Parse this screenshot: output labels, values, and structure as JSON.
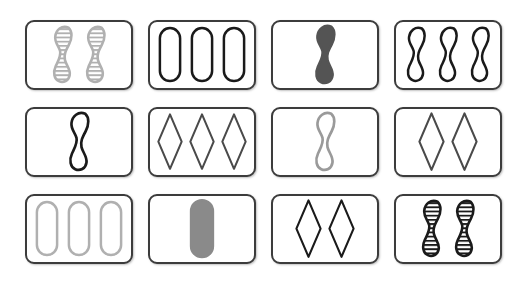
{
  "game": {
    "name": "SET card game board",
    "layout": {
      "rows": 3,
      "columns": 4,
      "total_cards": 12
    },
    "palette": {
      "card_border": "#3c3c3c",
      "card_face": "#ffffff",
      "background": "#ffffff",
      "black": "#1a1a1a",
      "dark_gray": "#545454",
      "medium_gray": "#8a8a8a",
      "light_gray": "#b5b5b5"
    },
    "attribute_options": {
      "shape": [
        "squiggle",
        "oval",
        "diamond"
      ],
      "count": [
        1,
        2,
        3
      ],
      "shading": [
        "solid",
        "striped",
        "empty"
      ],
      "color": [
        "black",
        "dark_gray",
        "medium_gray",
        "light_gray"
      ]
    }
  },
  "cards": [
    {
      "position": "row1-col1",
      "label": "two gray striped squiggles",
      "shape": "squiggle",
      "count": 2,
      "shading": "striped",
      "color": "light_gray",
      "hex": "#b0b0b0"
    },
    {
      "position": "row1-col2",
      "label": "three black empty ovals",
      "shape": "oval",
      "count": 3,
      "shading": "empty",
      "color": "black",
      "hex": "#1a1a1a"
    },
    {
      "position": "row1-col3",
      "label": "one dark gray solid squiggle",
      "shape": "squiggle",
      "count": 1,
      "shading": "solid",
      "color": "dark_gray",
      "hex": "#545454"
    },
    {
      "position": "row1-col4",
      "label": "three black empty squiggles",
      "shape": "squiggle",
      "count": 3,
      "shading": "empty",
      "color": "black",
      "hex": "#1a1a1a"
    },
    {
      "position": "row2-col1",
      "label": "one black empty squiggle",
      "shape": "squiggle",
      "count": 1,
      "shading": "empty",
      "color": "black",
      "hex": "#1a1a1a"
    },
    {
      "position": "row2-col2",
      "label": "three dark gray empty diamonds",
      "shape": "diamond",
      "count": 3,
      "shading": "empty",
      "color": "dark_gray",
      "hex": "#4a4a4a"
    },
    {
      "position": "row2-col3",
      "label": "one light gray empty squiggle",
      "shape": "squiggle",
      "count": 1,
      "shading": "empty",
      "color": "light_gray",
      "hex": "#9a9a9a"
    },
    {
      "position": "row2-col4",
      "label": "two dark gray empty diamonds",
      "shape": "diamond",
      "count": 2,
      "shading": "empty",
      "color": "dark_gray",
      "hex": "#4a4a4a"
    },
    {
      "position": "row3-col1",
      "label": "three light gray empty ovals",
      "shape": "oval",
      "count": 3,
      "shading": "empty",
      "color": "light_gray",
      "hex": "#b0b0b0"
    },
    {
      "position": "row3-col2",
      "label": "one medium gray solid oval",
      "shape": "oval",
      "count": 1,
      "shading": "solid",
      "color": "medium_gray",
      "hex": "#8a8a8a"
    },
    {
      "position": "row3-col3",
      "label": "two black empty diamonds",
      "shape": "diamond",
      "count": 2,
      "shading": "empty",
      "color": "black",
      "hex": "#1a1a1a"
    },
    {
      "position": "row3-col4",
      "label": "two black striped squiggles",
      "shape": "squiggle",
      "count": 2,
      "shading": "striped",
      "color": "black",
      "hex": "#1a1a1a"
    }
  ]
}
